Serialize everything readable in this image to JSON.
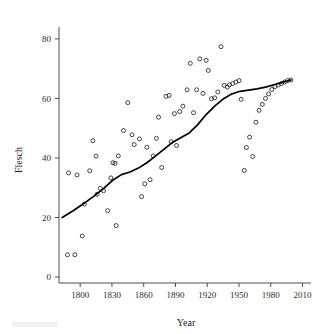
{
  "figure": {
    "background_color": "#ffffff",
    "point_color": "#222222",
    "line_color": "#000000",
    "axis_color": "#3a3a3a"
  },
  "chart_data": {
    "type": "scatter",
    "title": "",
    "xlabel": "Year",
    "ylabel": "Flesch",
    "xlim": [
      1780,
      2018
    ],
    "ylim": [
      -2,
      84
    ],
    "grid": false,
    "legend": null,
    "xticks": [
      1800,
      1830,
      1860,
      1890,
      1920,
      1950,
      1980,
      2010
    ],
    "xticklabels": [
      "1800",
      "1830",
      "1860",
      "1890",
      "1920",
      "1950",
      "1980",
      "2010"
    ],
    "yticks": [
      0,
      20,
      40,
      60,
      80
    ],
    "yticklabels": [
      "0",
      "20",
      "40",
      "60",
      "80"
    ],
    "series": [
      {
        "name": "Flesch reading ease by year",
        "marker": "open-circle",
        "x": [
          1788,
          1795,
          1789,
          1797,
          1802,
          1804,
          1809,
          1812,
          1815,
          1816,
          1819,
          1822,
          1826,
          1829,
          1831,
          1833,
          1834,
          1836,
          1841,
          1845,
          1849,
          1851,
          1856,
          1858,
          1861,
          1863,
          1866,
          1869,
          1872,
          1874,
          1877,
          1881,
          1884,
          1886,
          1889,
          1891,
          1894,
          1897,
          1901,
          1904,
          1907,
          1910,
          1913,
          1916,
          1919,
          1921,
          1924,
          1927,
          1930,
          1933,
          1936,
          1939,
          1941,
          1944,
          1947,
          1950,
          1952,
          1955,
          1957,
          1960,
          1963,
          1966,
          1969,
          1972,
          1975,
          1978,
          1981,
          1984,
          1987,
          1990,
          1993,
          1996,
          1999
        ],
        "y": [
          7.5,
          7.5,
          35.0,
          34.3,
          13.8,
          24.5,
          35.7,
          45.8,
          40.6,
          27.8,
          29.8,
          29.0,
          22.3,
          33.3,
          38.4,
          38.2,
          17.3,
          40.7,
          49.2,
          58.6,
          47.8,
          44.5,
          46.4,
          27.0,
          31.3,
          43.6,
          32.7,
          40.7,
          46.6,
          53.7,
          36.8,
          60.7,
          61.0,
          45.5,
          54.9,
          44.2,
          55.6,
          57.4,
          62.9,
          71.8,
          55.2,
          62.9,
          73.3,
          61.7,
          72.8,
          69.4,
          59.9,
          60.2,
          62.2,
          77.4,
          64.4,
          63.8,
          64.6,
          65.0,
          65.5,
          66.0,
          59.7,
          35.8,
          43.5,
          47.0,
          40.5,
          52.0,
          56.0,
          58.0,
          60.0,
          61.5,
          63.0,
          64.0,
          64.5,
          65.0,
          65.5,
          66.0,
          66.2
        ]
      }
    ],
    "fit_line": {
      "name": "loess-smoother",
      "x": [
        1783,
        1793,
        1803,
        1813,
        1823,
        1831,
        1839,
        1847,
        1855,
        1863,
        1871,
        1879,
        1887,
        1895,
        1903,
        1911,
        1919,
        1927,
        1935,
        1943,
        1951,
        1959,
        1967,
        1975,
        1983,
        1991,
        1999
      ],
      "y": [
        20.0,
        22.2,
        24.6,
        27.2,
        30.0,
        32.6,
        34.4,
        35.3,
        36.6,
        38.4,
        40.6,
        42.9,
        45.2,
        46.8,
        48.4,
        51.2,
        54.6,
        57.4,
        59.8,
        61.5,
        62.4,
        62.8,
        63.2,
        63.8,
        64.6,
        65.4,
        66.2
      ]
    }
  }
}
